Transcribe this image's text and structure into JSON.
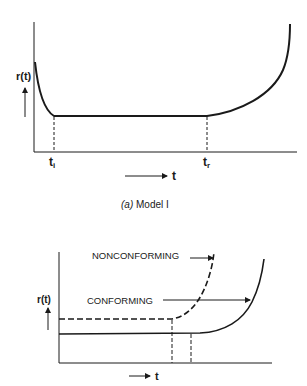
{
  "figure_a": {
    "ylabel": "r(t)",
    "xlabel": "t",
    "tick_i": "t",
    "tick_i_sub": "i",
    "tick_r": "t",
    "tick_r_sub": "r",
    "caption_prefix": "(a)",
    "caption": "Model I"
  },
  "figure_b": {
    "ylabel": "r(t)",
    "xlabel": "t",
    "label_nonconforming": "NONCONFORMING",
    "label_conforming": "CONFORMING"
  },
  "colors": {
    "line": "#1a1a1a",
    "background": "#ffffff"
  }
}
